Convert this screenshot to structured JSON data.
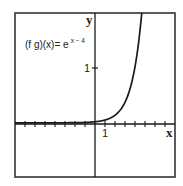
{
  "chart_data": {
    "type": "line",
    "title": "",
    "function_label": {
      "prefix": "(f g)(x)= e",
      "exponent": "x − 4"
    },
    "expression": "e^(x-4)",
    "xlabel": "x",
    "ylabel": "y",
    "x_tick_labels": [
      {
        "value": 1,
        "label": "1"
      }
    ],
    "y_tick_labels": [
      {
        "value": 1,
        "label": "1"
      }
    ],
    "xlim": [
      -8,
      8
    ],
    "ylim": [
      -0.95,
      1.98
    ],
    "x_tick_step": 1,
    "grid": false,
    "legend": null,
    "series": [
      {
        "name": "(f g)(x) = e^(x-4)",
        "x": [
          -8,
          -4,
          -2,
          0,
          1,
          2,
          3,
          3.5,
          4,
          4.3,
          4.5,
          4.68
        ],
        "y": [
          0.0,
          0.0003,
          0.0025,
          0.018,
          0.05,
          0.135,
          0.368,
          0.607,
          1.0,
          1.35,
          1.65,
          1.97
        ]
      }
    ]
  },
  "colors": {
    "axis": "#1a1a1a",
    "curve": "#1a1a1a",
    "frame": "#333333",
    "background": "#ffffff"
  }
}
